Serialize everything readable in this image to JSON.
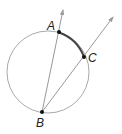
{
  "diagram": {
    "type": "inscribed-angle",
    "circle": {
      "cx": 48,
      "cy": 72,
      "r": 41,
      "stroke": "#aaaaaa"
    },
    "arc_highlight": {
      "from": "A",
      "to": "C",
      "stroke": "#444444"
    },
    "points": [
      {
        "id": "A",
        "label": "A",
        "x": 59,
        "y": 32,
        "label_x": 47,
        "label_y": 30
      },
      {
        "id": "B",
        "label": "B",
        "x": 42,
        "y": 112,
        "label_x": 36,
        "label_y": 127
      },
      {
        "id": "C",
        "label": "C",
        "x": 84,
        "y": 57,
        "label_x": 88,
        "label_y": 62
      }
    ],
    "rays": [
      {
        "from": "B",
        "through": "A",
        "tip_x": 63,
        "tip_y": 10
      },
      {
        "from": "B",
        "through": "C",
        "tip_x": 113,
        "tip_y": 17
      }
    ],
    "colors": {
      "line": "#999999",
      "point": "#111111",
      "arc": "#444444"
    }
  }
}
